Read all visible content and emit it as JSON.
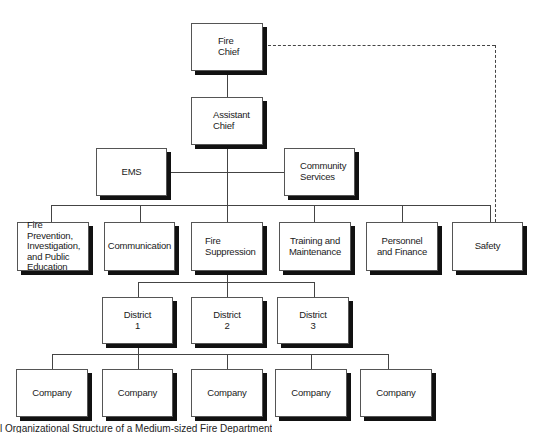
{
  "diagram": {
    "type": "organizational-chart",
    "nodes": {
      "fire_chief": "Fire\nChief",
      "assistant_chief": "Assistant\nChief",
      "ems": "EMS",
      "community_services": "Community\nServices",
      "fire_prevention": "Fire Prevention,\nInvestigation,\nand Public\nEducation",
      "communication": "Communication",
      "fire_suppression": "Fire\nSuppression",
      "training": "Training and\nMaintenance",
      "personnel": "Personnel\nand Finance",
      "safety": "Safety",
      "district_1": "District\n1",
      "district_2": "District\n2",
      "district_3": "District\n3",
      "company_1": "Company",
      "company_2": "Company",
      "company_3": "Company",
      "company_4": "Company",
      "company_5": "Company"
    },
    "relationships": [
      {
        "from": "Fire Chief",
        "to": "Assistant Chief",
        "style": "solid"
      },
      {
        "from": "Fire Chief",
        "to": "Safety",
        "style": "dashed"
      },
      {
        "from": "Assistant Chief",
        "to": "EMS",
        "style": "solid"
      },
      {
        "from": "Assistant Chief",
        "to": "Community Services",
        "style": "solid"
      },
      {
        "from": "Assistant Chief",
        "to": "Fire Prevention, Investigation, and Public Education",
        "style": "solid"
      },
      {
        "from": "Assistant Chief",
        "to": "Communication",
        "style": "solid"
      },
      {
        "from": "Assistant Chief",
        "to": "Fire Suppression",
        "style": "solid"
      },
      {
        "from": "Assistant Chief",
        "to": "Training and Maintenance",
        "style": "solid"
      },
      {
        "from": "Assistant Chief",
        "to": "Personnel and Finance",
        "style": "solid"
      },
      {
        "from": "Assistant Chief",
        "to": "Safety",
        "style": "solid"
      },
      {
        "from": "Fire Suppression",
        "to": "District 1",
        "style": "solid"
      },
      {
        "from": "Fire Suppression",
        "to": "District 2",
        "style": "solid"
      },
      {
        "from": "Fire Suppression",
        "to": "District 3",
        "style": "solid"
      },
      {
        "from": "District 1",
        "to": "Company (x5)",
        "style": "solid"
      }
    ],
    "caption": "l Organizational Structure of a Medium-sized Fire Department"
  }
}
